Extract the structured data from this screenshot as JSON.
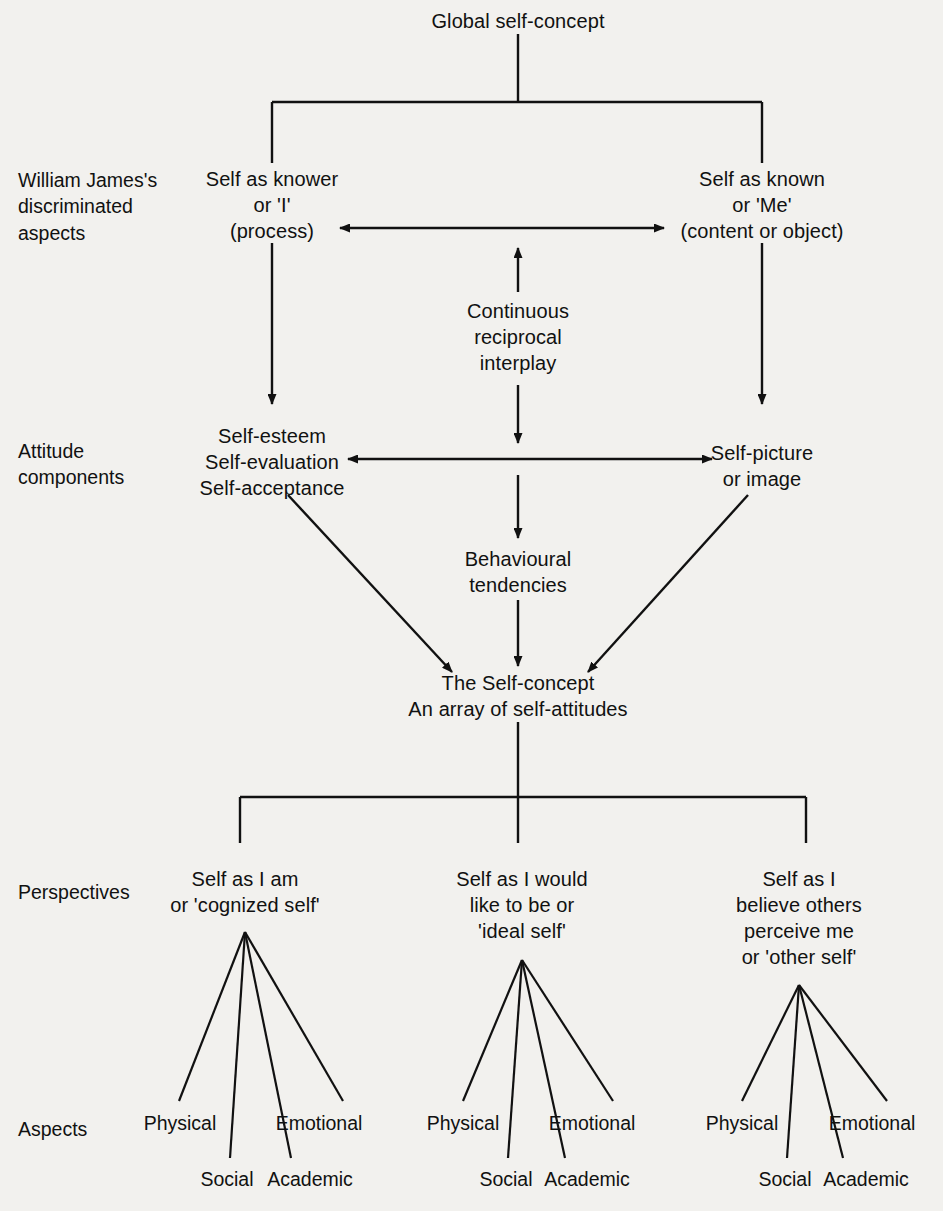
{
  "diagram": {
    "title": "Global self-concept",
    "row_labels": [
      {
        "id": "james",
        "text": "William James's\ndiscriminated\naspects"
      },
      {
        "id": "attitude",
        "text": "Attitude\ncomponents"
      },
      {
        "id": "perspectives",
        "text": "Perspectives"
      },
      {
        "id": "aspects",
        "text": "Aspects"
      }
    ],
    "nodes": {
      "root": "Global self-concept",
      "self_as_knower": "Self as knower\nor 'I'\n(process)",
      "self_as_known": "Self as known\nor 'Me'\n(content or object)",
      "interplay": "Continuous\nreciprocal\ninterplay",
      "self_esteem": "Self-esteem\nSelf-evaluation\nSelf-acceptance",
      "self_picture": "Self-picture\nor image",
      "behavioural": "Behavioural\ntendencies",
      "self_concept": "The Self-concept\nAn array of self-attitudes"
    },
    "perspectives": [
      {
        "id": "cognized-self",
        "text": "Self as I am\nor 'cognized self'"
      },
      {
        "id": "ideal-self",
        "text": "Self as I would\nlike to be or\n'ideal self'"
      },
      {
        "id": "other-self",
        "text": "Self as I\nbelieve others\nperceive me\nor 'other self'"
      }
    ],
    "aspects": [
      {
        "physical": "Physical",
        "social": "Social",
        "academic": "Academic",
        "emotional": "Emotional"
      },
      {
        "physical": "Physical",
        "social": "Social",
        "academic": "Academic",
        "emotional": "Emotional"
      },
      {
        "physical": "Physical",
        "social": "Social",
        "academic": "Academic",
        "emotional": "Emotional"
      }
    ],
    "colors": {
      "background": "#f2f1ee",
      "ink": "#111111"
    }
  }
}
